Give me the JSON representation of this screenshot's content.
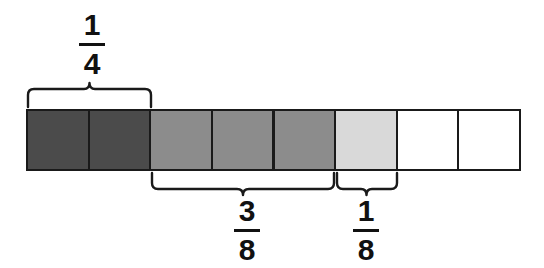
{
  "figure": {
    "background_color": "#ffffff",
    "line_color": "#1a1a1a",
    "bar": {
      "x": 27,
      "y": 110,
      "width": 493,
      "height": 60,
      "segments_total": 8,
      "segment_width": 61.6,
      "border_color": "#1a1a1a",
      "segments": [
        {
          "index": 1,
          "shade": "dark",
          "color": "#4b4b4b"
        },
        {
          "index": 2,
          "shade": "dark",
          "color": "#4b4b4b"
        },
        {
          "index": 3,
          "shade": "medium",
          "color": "#8c8c8c"
        },
        {
          "index": 4,
          "shade": "medium",
          "color": "#8c8c8c"
        },
        {
          "index": 5,
          "shade": "medium",
          "color": "#8c8c8c"
        },
        {
          "index": 6,
          "shade": "light",
          "color": "#d9d9d9"
        },
        {
          "index": 7,
          "shade": "white",
          "color": "#ffffff"
        },
        {
          "index": 8,
          "shade": "white",
          "color": "#ffffff"
        }
      ]
    },
    "braces": [
      {
        "id": "quarter-brace",
        "position": "above",
        "x_start": 27,
        "x_end": 151,
        "covers_segments": [
          1,
          2
        ],
        "label_numerator": "1",
        "label_denominator": "4"
      },
      {
        "id": "three-eighths-brace",
        "position": "below",
        "x_start": 152,
        "x_end": 334,
        "covers_segments": [
          3,
          4,
          5
        ],
        "label_numerator": "3",
        "label_denominator": "8"
      },
      {
        "id": "one-eighth-brace",
        "position": "below",
        "x_start": 336,
        "x_end": 397,
        "covers_segments": [
          6
        ],
        "label_numerator": "1",
        "label_denominator": "8"
      }
    ],
    "labels": {
      "quarter": {
        "numerator": "1",
        "denominator": "4"
      },
      "three_eighths": {
        "numerator": "3",
        "denominator": "8"
      },
      "one_eighth": {
        "numerator": "1",
        "denominator": "8"
      }
    }
  }
}
